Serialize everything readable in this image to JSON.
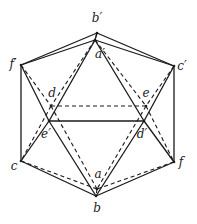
{
  "diagram": {
    "type": "icosahedron-projection",
    "vertices": {
      "b_prime": {
        "label": "b′",
        "x": 97,
        "y": 33,
        "lx": 97,
        "ly": 22
      },
      "a_prime": {
        "label": "a′",
        "x": 95,
        "y": 40,
        "lx": 100,
        "ly": 58
      },
      "f_prime": {
        "label": "f′",
        "x": 21,
        "y": 65,
        "lx": 13,
        "ly": 68
      },
      "c_prime": {
        "label": "c′",
        "x": 174,
        "y": 66,
        "lx": 182,
        "ly": 70
      },
      "d": {
        "label": "d",
        "x": 51,
        "y": 106,
        "lx": 52,
        "ly": 97
      },
      "e": {
        "label": "e",
        "x": 146,
        "y": 106,
        "lx": 146,
        "ly": 97
      },
      "e_prime": {
        "label": "e′",
        "x": 49,
        "y": 121,
        "lx": 46,
        "ly": 138
      },
      "d_prime": {
        "label": "d′",
        "x": 144,
        "y": 121,
        "lx": 142,
        "ly": 138
      },
      "c": {
        "label": "c",
        "x": 21,
        "y": 161,
        "lx": 14,
        "ly": 170
      },
      "f": {
        "label": "f",
        "x": 174,
        "y": 162,
        "lx": 181,
        "ly": 166
      },
      "a": {
        "label": "a",
        "x": 97,
        "y": 189,
        "lx": 98,
        "ly": 178
      },
      "b": {
        "label": "b",
        "x": 96,
        "y": 196,
        "lx": 97,
        "ly": 212
      }
    },
    "solid_edges": [
      [
        "b_prime",
        "f_prime"
      ],
      [
        "b_prime",
        "c_prime"
      ],
      [
        "a_prime",
        "f_prime"
      ],
      [
        "a_prime",
        "c_prime"
      ],
      [
        "f_prime",
        "c"
      ],
      [
        "c_prime",
        "f"
      ],
      [
        "f_prime",
        "e_prime"
      ],
      [
        "a_prime",
        "e_prime"
      ],
      [
        "a_prime",
        "d_prime"
      ],
      [
        "c_prime",
        "d_prime"
      ],
      [
        "e_prime",
        "d_prime"
      ],
      [
        "e_prime",
        "c"
      ],
      [
        "e_prime",
        "b"
      ],
      [
        "d_prime",
        "b"
      ],
      [
        "d_prime",
        "f"
      ],
      [
        "c",
        "b"
      ],
      [
        "f",
        "b"
      ],
      [
        "b_prime",
        "a_prime"
      ]
    ],
    "dashed_edges": [
      [
        "f_prime",
        "d"
      ],
      [
        "a_prime",
        "d"
      ],
      [
        "a_prime",
        "e"
      ],
      [
        "c_prime",
        "e"
      ],
      [
        "d",
        "e"
      ],
      [
        "d",
        "c"
      ],
      [
        "d",
        "a"
      ],
      [
        "e",
        "a"
      ],
      [
        "e",
        "f"
      ],
      [
        "c",
        "a"
      ],
      [
        "f",
        "a"
      ],
      [
        "a",
        "b"
      ],
      [
        "b_prime",
        "a_prime"
      ]
    ]
  }
}
